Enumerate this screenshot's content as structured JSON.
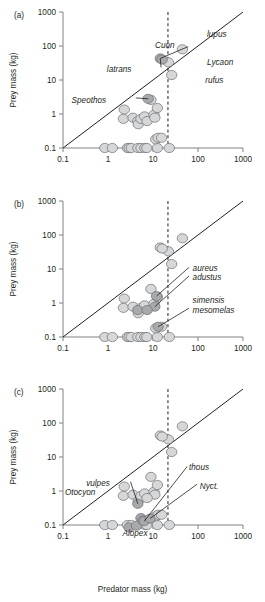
{
  "figure": {
    "x_axis_title": "Predator mass (kg)",
    "y_axis_title": "Prey mass (kg)",
    "panel_labels": [
      "(a)",
      "(b)",
      "(c)"
    ],
    "tick_labels_x": [
      "0.1",
      "1",
      "10",
      "100",
      "1000"
    ],
    "tick_labels_y": [
      "0.1",
      "1",
      "10",
      "100",
      "1000"
    ],
    "colors": {
      "marker_light": "#d6d7d9",
      "marker_dark": "#a7a9ac",
      "marker_edge": "#6d6e71",
      "axis": "#808285",
      "line": "#231f20",
      "text": "#231f20",
      "background": "#ffffff"
    }
  },
  "chart_data": {
    "type": "scatter",
    "title": "",
    "xlabel": "Predator mass (kg)",
    "ylabel": "Prey mass (kg)",
    "xscale": "log",
    "yscale": "log",
    "xlim": [
      0.1,
      1000
    ],
    "ylim": [
      0.1,
      1000
    ],
    "xticks": [
      0.1,
      1,
      10,
      100,
      1000
    ],
    "yticks": [
      0.1,
      1,
      10,
      100,
      1000
    ],
    "grid": false,
    "legend": "none",
    "annotations": {
      "identity_line": {
        "label": "y = x reference line",
        "from": [
          0.1,
          0.1
        ],
        "to": [
          1000,
          1000
        ]
      },
      "threshold_line": {
        "label": "vertical dashed threshold",
        "x": 21.5
      }
    },
    "panels": [
      {
        "id": "a",
        "label": "(a)",
        "series": [
          {
            "name": "other canids",
            "color": "#d6d7d9",
            "points": [
              [
                0.85,
                0.1
              ],
              [
                1.25,
                0.1
              ],
              [
                2.7,
                0.1
              ],
              [
                2.95,
                0.1
              ],
              [
                3.3,
                0.1
              ],
              [
                4.6,
                0.1
              ],
              [
                5.4,
                0.1
              ],
              [
                6.6,
                0.1
              ],
              [
                7.3,
                0.1
              ],
              [
                12.5,
                0.1
              ],
              [
                23.0,
                0.1
              ],
              [
                11.5,
                0.18
              ],
              [
                13.0,
                0.2
              ],
              [
                15.5,
                0.2
              ],
              [
                2.3,
                1.35
              ],
              [
                2.2,
                0.72
              ],
              [
                3.6,
                0.78
              ],
              [
                4.6,
                0.62
              ],
              [
                4.7,
                0.5
              ],
              [
                5.4,
                0.72
              ],
              [
                6.5,
                0.85
              ],
              [
                7.4,
                0.62
              ],
              [
                9.0,
                2.6
              ],
              [
                10.5,
                0.95
              ],
              [
                12.5,
                1.5
              ],
              [
                11.0,
                0.78
              ],
              [
                45.0,
                80.0
              ],
              [
                22.0,
                33.0
              ],
              [
                26.0,
                14.0
              ]
            ]
          },
          {
            "name": "highlighted genera",
            "color": "#a7a9ac",
            "points": [
              [
                14.5,
                43.0
              ],
              [
                16.0,
                40.0
              ],
              [
                7.8,
                2.8
              ]
            ]
          }
        ],
        "labels": [
          {
            "text": "Cuon",
            "x": 0.62,
            "y": 0.76
          },
          {
            "text": "latrans",
            "x": 0.38,
            "y": 0.58
          },
          {
            "text": "lupus",
            "x": 0.8,
            "y": 0.84
          },
          {
            "text": "Lycaon",
            "x": 0.8,
            "y": 0.63
          },
          {
            "text": "rufus",
            "x": 0.79,
            "y": 0.5
          },
          {
            "text": "Speothos",
            "x": 0.24,
            "y": 0.35
          }
        ]
      },
      {
        "id": "b",
        "label": "(b)",
        "series": [
          {
            "name": "other canids",
            "color": "#d6d7d9",
            "points": [
              [
                0.85,
                0.1
              ],
              [
                1.25,
                0.1
              ],
              [
                2.7,
                0.1
              ],
              [
                2.95,
                0.1
              ],
              [
                3.3,
                0.1
              ],
              [
                4.6,
                0.1
              ],
              [
                5.4,
                0.1
              ],
              [
                6.6,
                0.1
              ],
              [
                7.3,
                0.1
              ],
              [
                12.5,
                0.1
              ],
              [
                23.0,
                0.1
              ],
              [
                11.5,
                0.18
              ],
              [
                15.5,
                0.2
              ],
              [
                2.3,
                1.35
              ],
              [
                2.2,
                0.72
              ],
              [
                3.6,
                0.78
              ],
              [
                4.7,
                0.5
              ],
              [
                5.4,
                0.72
              ],
              [
                6.5,
                0.85
              ],
              [
                9.0,
                2.6
              ],
              [
                10.5,
                0.95
              ],
              [
                12.5,
                1.5
              ],
              [
                45.0,
                80.0
              ],
              [
                22.0,
                33.0
              ],
              [
                26.0,
                14.0
              ],
              [
                14.5,
                43.0
              ],
              [
                16.0,
                40.0
              ]
            ]
          },
          {
            "name": "highlighted genera",
            "color": "#a7a9ac",
            "points": [
              [
                12.0,
                1.6
              ],
              [
                11.0,
                0.78
              ],
              [
                4.6,
                0.62
              ],
              [
                7.4,
                0.62
              ],
              [
                13.0,
                0.2
              ]
            ]
          }
        ],
        "labels": [
          {
            "text": "aureus",
            "x": 0.72,
            "y": 0.51
          },
          {
            "text": "adustus",
            "x": 0.72,
            "y": 0.44
          },
          {
            "text": "simensis",
            "x": 0.72,
            "y": 0.27
          },
          {
            "text": "mesomelas",
            "x": 0.72,
            "y": 0.2
          }
        ]
      },
      {
        "id": "c",
        "label": "(c)",
        "series": [
          {
            "name": "other canids",
            "color": "#d6d7d9",
            "points": [
              [
                0.85,
                0.1
              ],
              [
                1.25,
                0.1
              ],
              [
                2.7,
                0.1
              ],
              [
                3.3,
                0.1
              ],
              [
                6.6,
                0.1
              ],
              [
                7.3,
                0.1
              ],
              [
                12.5,
                0.1
              ],
              [
                23.0,
                0.1
              ],
              [
                11.5,
                0.18
              ],
              [
                13.0,
                0.2
              ],
              [
                15.5,
                0.2
              ],
              [
                2.3,
                1.35
              ],
              [
                2.2,
                0.72
              ],
              [
                3.6,
                0.78
              ],
              [
                4.7,
                0.5
              ],
              [
                5.4,
                0.72
              ],
              [
                6.5,
                0.85
              ],
              [
                9.0,
                2.6
              ],
              [
                10.5,
                0.95
              ],
              [
                12.5,
                1.5
              ],
              [
                11.0,
                0.78
              ],
              [
                7.4,
                0.62
              ],
              [
                45.0,
                80.0
              ],
              [
                22.0,
                33.0
              ],
              [
                26.0,
                14.0
              ],
              [
                14.5,
                43.0
              ],
              [
                16.0,
                40.0
              ]
            ]
          },
          {
            "name": "highlighted genera",
            "color": "#a7a9ac",
            "points": [
              [
                4.6,
                0.42
              ],
              [
                2.95,
                0.085
              ],
              [
                4.3,
                0.095
              ],
              [
                5.4,
                0.16
              ],
              [
                6.0,
                0.135
              ],
              [
                6.4,
                0.13
              ],
              [
                8.6,
                0.155
              ]
            ]
          }
        ],
        "labels": [
          {
            "text": "vulpes",
            "x": 0.26,
            "y": 0.31
          },
          {
            "text": "Otocyon",
            "x": 0.18,
            "y": 0.24
          },
          {
            "text": "thous",
            "x": 0.7,
            "y": 0.43
          },
          {
            "text": "Nyct.",
            "x": 0.76,
            "y": 0.29
          },
          {
            "text": "Alopex",
            "x": 0.4,
            "y": -0.06
          }
        ]
      }
    ]
  }
}
